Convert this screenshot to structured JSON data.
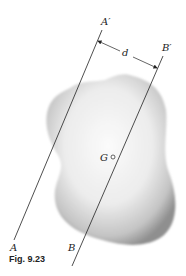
{
  "figure": {
    "caption": "Fig. 9.23",
    "labels": {
      "a_prime": "A′",
      "b_prime": "B′",
      "a": "A",
      "b": "B",
      "centroid": "G",
      "distance": "d"
    },
    "elements": [
      "axis AA′ (arbitrary axis)",
      "axis BB′ (centroidal axis through G, parallel to AA′)",
      "distance d between parallel axes",
      "shaded body / area"
    ],
    "colors": {
      "line": "#222222",
      "shade_dark": "#8a8a8a",
      "shade_light": "#f4f4f4",
      "background": "#ffffff"
    }
  }
}
